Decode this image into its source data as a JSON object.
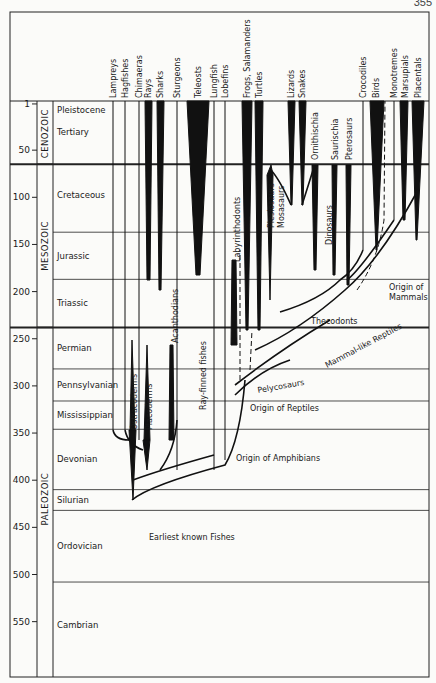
{
  "page": {
    "number": "355"
  },
  "axis": {
    "ticks": [
      {
        "label": "1",
        "ma": 1
      },
      {
        "label": "50",
        "ma": 50
      },
      {
        "label": "100",
        "ma": 100
      },
      {
        "label": "150",
        "ma": 150
      },
      {
        "label": "200",
        "ma": 200
      },
      {
        "label": "250",
        "ma": 250
      },
      {
        "label": "300",
        "ma": 300
      },
      {
        "label": "350",
        "ma": 350
      },
      {
        "label": "400",
        "ma": 400
      },
      {
        "label": "450",
        "ma": 450
      },
      {
        "label": "500",
        "ma": 500
      },
      {
        "label": "550",
        "ma": 550
      }
    ]
  },
  "eras": [
    {
      "name": "CENOZOIC",
      "top": 0,
      "bottom": 65
    },
    {
      "name": "MESOZOIC",
      "top": 65,
      "bottom": 238
    },
    {
      "name": "PALEOZOIC",
      "top": 238,
      "bottom": 600
    }
  ],
  "periods": [
    {
      "name": "Pleistocene",
      "top": 0,
      "bottom": 2
    },
    {
      "name": "Tertiary",
      "top": 2,
      "bottom": 65
    },
    {
      "name": "Cretaceous",
      "top": 65,
      "bottom": 137
    },
    {
      "name": "Jurassic",
      "top": 137,
      "bottom": 187
    },
    {
      "name": "Triassic",
      "top": 187,
      "bottom": 238
    },
    {
      "name": "Permian",
      "top": 238,
      "bottom": 282
    },
    {
      "name": "Pennsylvanian",
      "top": 282,
      "bottom": 316
    },
    {
      "name": "Mississippian",
      "top": 316,
      "bottom": 346
    },
    {
      "name": "Devonian",
      "top": 346,
      "bottom": 410
    },
    {
      "name": "Silurian",
      "top": 410,
      "bottom": 432
    },
    {
      "name": "Ordovician",
      "top": 432,
      "bottom": 508
    },
    {
      "name": "Cambrian",
      "top": 508,
      "bottom": 600
    }
  ],
  "taxa": [
    {
      "name": "Lampreys",
      "x": 113
    },
    {
      "name": "Hagfishes",
      "x": 125
    },
    {
      "name": "Chimaeras",
      "x": 139
    },
    {
      "name": "Rays",
      "x": 148
    },
    {
      "name": "Sharks",
      "x": 160
    },
    {
      "name": "Sturgeons",
      "x": 177
    },
    {
      "name": "Teleosts",
      "x": 198
    },
    {
      "name": "Lungfish",
      "x": 214
    },
    {
      "name": "Lobefins",
      "x": 225
    },
    {
      "name": "Frogs, Salamanders",
      "x": 247
    },
    {
      "name": "Turtles",
      "x": 259
    },
    {
      "name": "Lizards",
      "x": 291
    },
    {
      "name": "Snakes",
      "x": 302
    },
    {
      "name": "Crocodiles",
      "x": 363
    },
    {
      "name": "Birds",
      "x": 376
    },
    {
      "name": "Monotremes",
      "x": 394
    },
    {
      "name": "Marsupials",
      "x": 405
    },
    {
      "name": "Placentals",
      "x": 418
    }
  ],
  "annotations": {
    "plesiosaurs": "Plesiosaurs",
    "mosasaurs": "Mosasaurs",
    "ornithischia": "Ornithischia",
    "saurischia": "Saurischia",
    "pterosaurs": "Pterosaurs",
    "dinosaurs": "Dinosaurs",
    "labyrinthodonts": "Labyrinthodonts",
    "acanthodians": "Acanthodians",
    "ray_finned": "Ray-finned fishes",
    "ostracoderms": "Ostracoderms",
    "placoderms": "Placoderms",
    "thecodonts": "Thecodonts",
    "origin_mammals_1": "Origin of",
    "origin_mammals_2": "Mammals",
    "mammal_like": "Mammal-like Reptiles",
    "pelycosaurs": "Pelycosaurs",
    "origin_reptiles": "Origin of Reptiles",
    "origin_amphibians": "Origin of Amphibians",
    "earliest_fishes": "Earliest known Fishes"
  }
}
